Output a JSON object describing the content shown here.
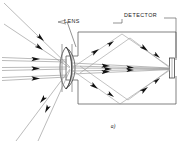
{
  "figure": {
    "caption": "a)",
    "title": "",
    "background_color": "#ffffff",
    "line_color": "#3a3a3a",
    "ray_color": "#8a8a8a",
    "arrow_color": "#111111",
    "text_color": "#1a1a1a",
    "width": 194,
    "height": 144
  },
  "labels": [
    {
      "id": "lens",
      "text": "LENS",
      "x": 64,
      "y": 22
    },
    {
      "id": "detector",
      "text": "DETECTOR",
      "x": 124,
      "y": 16
    }
  ],
  "components": [
    {
      "id": "lens-element",
      "name": "biconvex-lens",
      "x": 71,
      "y": 68
    },
    {
      "id": "detector-element",
      "name": "detector-plate",
      "x": 172,
      "y": 68
    },
    {
      "id": "enclosure",
      "name": "housing-box",
      "x": 76,
      "y": 32,
      "w": 100,
      "h": 72
    }
  ],
  "ray_groups": [
    {
      "id": "incoming-parallel",
      "name": "incoming-parallel-rays",
      "count": 3
    },
    {
      "id": "incoming-oblique-upper",
      "name": "oblique-rays-upper-left",
      "count": 2
    },
    {
      "id": "incoming-oblique-lower",
      "name": "oblique-rays-lower-left",
      "count": 2
    },
    {
      "id": "converging",
      "name": "converging-rays-to-detector",
      "count": 5
    },
    {
      "id": "stray-upper",
      "name": "stray-rays-upper",
      "count": 2
    },
    {
      "id": "stray-lower",
      "name": "stray-rays-lower",
      "count": 2
    }
  ]
}
